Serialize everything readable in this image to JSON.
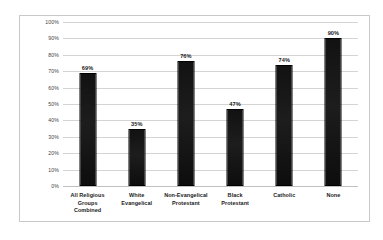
{
  "chart_data": {
    "type": "bar",
    "title": "",
    "subtitle": "",
    "xlabel": "",
    "ylabel": "",
    "ylim": [
      0,
      100
    ],
    "yticks": [
      "0%",
      "10%",
      "20%",
      "30%",
      "40%",
      "50%",
      "60%",
      "70%",
      "80%",
      "90%",
      "100%"
    ],
    "ytick_values": [
      0,
      10,
      20,
      30,
      40,
      50,
      60,
      70,
      80,
      90,
      100
    ],
    "grid": true,
    "legend": false,
    "legend_position": "none",
    "categories": [
      "All Religious Groups Combined",
      "White Evangelical",
      "Non-Evangelical Protestant",
      "Black Protestant",
      "Catholic",
      "None"
    ],
    "category_label_lines": [
      [
        "All Religious",
        "Groups",
        "Combined"
      ],
      [
        "White",
        "Evangelical"
      ],
      [
        "Non-Evangelical",
        "Protestant"
      ],
      [
        "Black",
        "Protestant"
      ],
      [
        "Catholic"
      ],
      [
        "None"
      ]
    ],
    "values": [
      69,
      35,
      76,
      47,
      74,
      90
    ],
    "data_labels": [
      "69%",
      "35%",
      "76%",
      "47%",
      "74%",
      "90%"
    ],
    "bar_color": "#141414",
    "gridline_color": "#d4d4d4",
    "plot_background": "#ffffff",
    "border_color": "#c9c9c9"
  }
}
